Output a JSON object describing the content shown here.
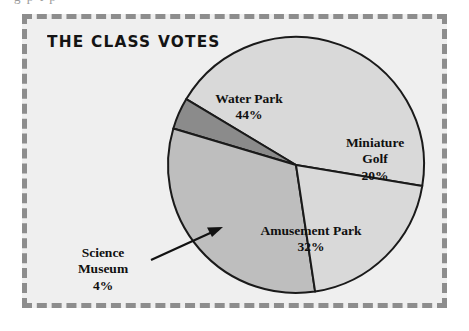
{
  "page": {
    "bleed_text": "g  p          t        p"
  },
  "panel": {
    "title": "THE CLASS VOTES",
    "background_color": "#efefef",
    "border_color": "#8d8d8d",
    "border_style": "dashed"
  },
  "chart_data": {
    "type": "pie",
    "title": "THE CLASS VOTES",
    "xlabel": "",
    "ylabel": "",
    "legend_position": "none",
    "grid": false,
    "units": "percent",
    "total": 100,
    "start_angle_deg": -59,
    "direction": "clockwise",
    "categories": [
      "Water Park",
      "Miniature Golf",
      "Amusement Park",
      "Science Museum"
    ],
    "values": [
      44,
      20,
      32,
      4
    ],
    "labels": [
      "44%",
      "20%",
      "32%",
      "4%"
    ],
    "colors": [
      "#d9d9d9",
      "#d9d9d9",
      "#bebebe",
      "#8b8b8b"
    ],
    "outline_color": "#1a1a1a",
    "slices": [
      {
        "name": "Water Park",
        "name_line1": "Water Park",
        "name_line2": "",
        "value": 44,
        "percent_label": "44%",
        "color": "#d9d9d9",
        "label_placement": "inside"
      },
      {
        "name": "Miniature Golf",
        "name_line1": "Miniature",
        "name_line2": "Golf",
        "value": 20,
        "percent_label": "20%",
        "color": "#d9d9d9",
        "label_placement": "inside"
      },
      {
        "name": "Amusement Park",
        "name_line1": "Amusement Park",
        "name_line2": "",
        "value": 32,
        "percent_label": "32%",
        "color": "#bebebe",
        "label_placement": "inside"
      },
      {
        "name": "Science Museum",
        "name_line1": "Science",
        "name_line2": "Museum",
        "value": 4,
        "percent_label": "4%",
        "color": "#8b8b8b",
        "label_placement": "outside-callout"
      }
    ]
  }
}
